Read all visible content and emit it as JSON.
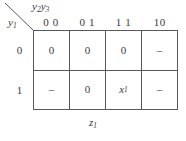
{
  "figure": {
    "type": "karnaugh-map",
    "caption": "z",
    "caption_sub": "1",
    "column_variables": "y",
    "column_variables_sub": "2",
    "column_variables_2": "y",
    "column_variables_2_sub": "3",
    "row_variable": "y",
    "row_variable_sub": "1",
    "column_headers": [
      "0 0",
      "0 1",
      "1 1",
      "10"
    ],
    "row_headers": [
      "0",
      "1"
    ],
    "cells": [
      [
        {
          "value": "0",
          "italic": false
        },
        {
          "value": "0",
          "italic": false
        },
        {
          "value": "0",
          "italic": false
        },
        {
          "value": "–",
          "italic": false
        }
      ],
      [
        {
          "value": "–",
          "italic": false
        },
        {
          "value": "0",
          "italic": false
        },
        {
          "value": "x",
          "sub": "1",
          "italic": true
        },
        {
          "value": "–",
          "italic": false
        }
      ]
    ],
    "colors": {
      "line": "#595959",
      "text": "#3a3a3a",
      "background": "#ffffff"
    }
  }
}
